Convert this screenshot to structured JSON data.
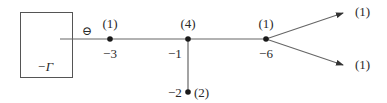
{
  "diagram": {
    "type": "graph-tree",
    "colors": {
      "line": "#555555",
      "node": "#1a1a1a",
      "text": "#2a2a2a",
      "box": "#555555"
    },
    "box": {
      "label": "−Γ",
      "x": 20,
      "y": 12,
      "width": 52,
      "height": 65
    },
    "edge_sign": "⊖",
    "nodes": [
      {
        "id": "n1",
        "weight_label": "(1)",
        "value_label": "−3",
        "x": 110,
        "y": 39
      },
      {
        "id": "n2",
        "weight_label": "(4)",
        "value_label": "−1",
        "x": 188,
        "y": 39
      },
      {
        "id": "n3",
        "weight_label": "(2)",
        "value_label": "−2",
        "x": 188,
        "y": 92
      },
      {
        "id": "n4",
        "weight_label": "(1)",
        "value_label": "−6",
        "x": 266,
        "y": 39
      }
    ],
    "arrows": [
      {
        "id": "a-up",
        "label": "(1)",
        "from": "n4",
        "to_x": 343,
        "to_y": 13
      },
      {
        "id": "a-down",
        "label": "(1)",
        "from": "n4",
        "to_x": 343,
        "to_y": 65
      }
    ],
    "edges": [
      {
        "from": "box",
        "to": "n1",
        "from_x": 60,
        "y": 39
      },
      {
        "from": "n1",
        "to": "n2"
      },
      {
        "from": "n2",
        "to": "n4"
      },
      {
        "from": "n2",
        "to": "n3"
      }
    ]
  }
}
